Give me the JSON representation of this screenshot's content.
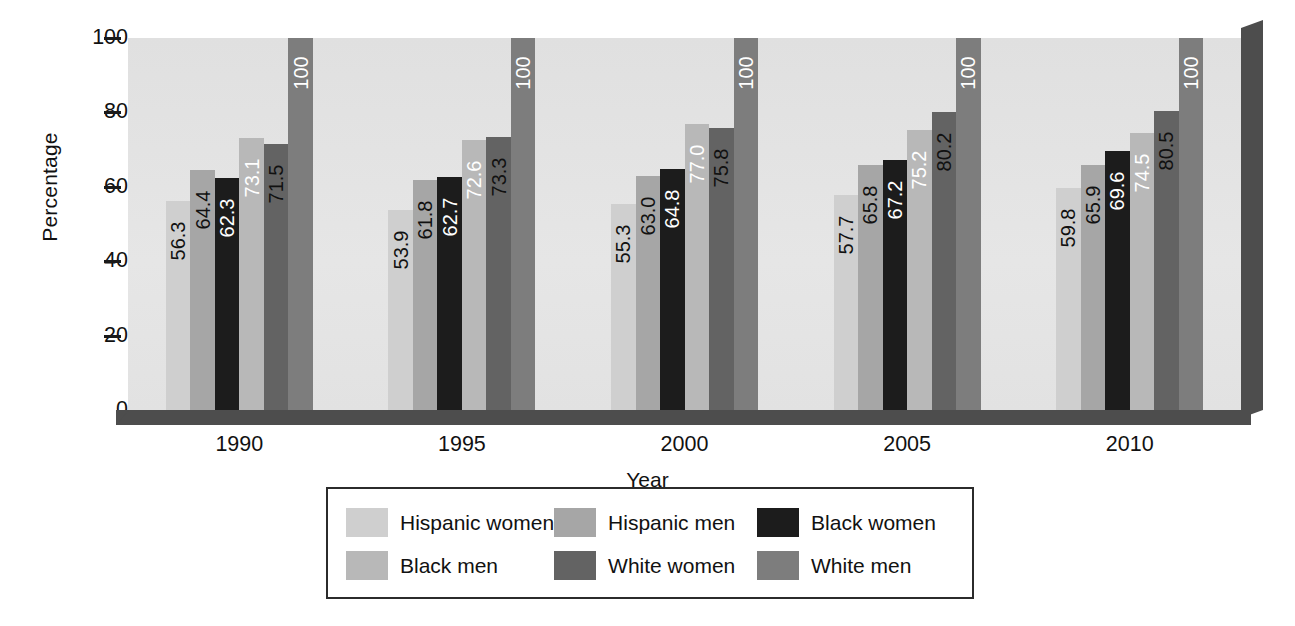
{
  "chart_data": {
    "type": "bar",
    "title": "",
    "xlabel": "Year",
    "ylabel": "Percentage",
    "ylim": [
      0,
      100
    ],
    "yticks": [
      0,
      20,
      40,
      60,
      80,
      100
    ],
    "grid": false,
    "legend_position": "bottom",
    "categories": [
      "1990",
      "1995",
      "2000",
      "2005",
      "2010"
    ],
    "series": [
      {
        "name": "Hispanic women",
        "color": "#cfcfcf",
        "label_color": "#111111",
        "values": [
          56.3,
          53.9,
          55.3,
          57.7,
          59.8
        ],
        "labels": [
          "56.3",
          "53.9",
          "55.3",
          "57.7",
          "59.8"
        ]
      },
      {
        "name": "Hispanic men",
        "color": "#a6a6a6",
        "label_color": "#111111",
        "values": [
          64.4,
          61.8,
          63.0,
          65.8,
          65.9
        ],
        "labels": [
          "64.4",
          "61.8",
          "63.0",
          "65.8",
          "65.9"
        ]
      },
      {
        "name": "Black women",
        "color": "#1c1c1c",
        "label_color": "#ffffff",
        "values": [
          62.3,
          62.7,
          64.8,
          67.2,
          69.6
        ],
        "labels": [
          "62.3",
          "62.7",
          "64.8",
          "67.2",
          "69.6"
        ]
      },
      {
        "name": "Black men",
        "color": "#b8b8b8",
        "label_color": "#ffffff",
        "values": [
          73.1,
          72.6,
          77.0,
          75.2,
          74.5
        ],
        "labels": [
          "73.1",
          "72.6",
          "77.0",
          "75.2",
          "74.5"
        ]
      },
      {
        "name": "White women",
        "color": "#636363",
        "label_color": "#111111",
        "values": [
          71.5,
          73.3,
          75.8,
          80.2,
          80.5
        ],
        "labels": [
          "71.5",
          "73.3",
          "75.8",
          "80.2",
          "80.5"
        ]
      },
      {
        "name": "White men",
        "color": "#7d7d7d",
        "label_color": "#ffffff",
        "values": [
          100,
          100,
          100,
          100,
          100
        ],
        "labels": [
          "100",
          "100",
          "100",
          "100",
          "100"
        ]
      }
    ]
  },
  "axes": {
    "y_label": "Percentage",
    "x_label": "Year",
    "y_ticks": [
      "100",
      "80",
      "60",
      "40",
      "20",
      "0"
    ],
    "x_ticks": [
      "1990",
      "1995",
      "2000",
      "2005",
      "2010"
    ]
  },
  "legend": {
    "items": [
      {
        "label": "Hispanic women",
        "color": "#cfcfcf"
      },
      {
        "label": "Hispanic men",
        "color": "#a6a6a6"
      },
      {
        "label": "Black women",
        "color": "#1c1c1c"
      },
      {
        "label": "Black men",
        "color": "#b8b8b8"
      },
      {
        "label": "White women",
        "color": "#636363"
      },
      {
        "label": "White men",
        "color": "#7d7d7d"
      }
    ]
  },
  "theme": {
    "plot_background": "#e2e2e2",
    "depth_shadow": "#4d4d4d",
    "page_background": "#ffffff",
    "text_color": "#111111"
  }
}
